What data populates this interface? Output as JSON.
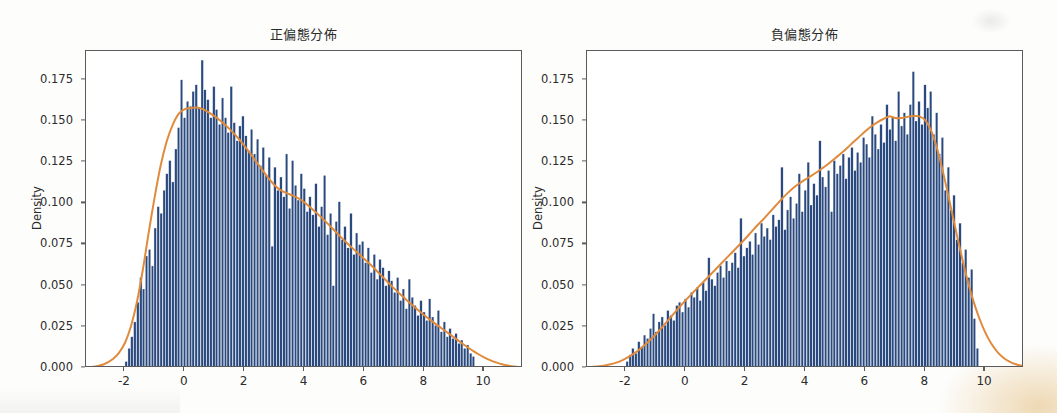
{
  "figure": {
    "background": "#fdfdfc",
    "panel_background": "#ffffff",
    "frame_color": "#5b5b5b"
  },
  "style": {
    "bar_color": "#2a4a7f",
    "bar_edge_color": "#ffffff",
    "kde_color": "#e08a3c",
    "text_color": "#2b2b2b"
  },
  "panels": [
    {
      "id": "left",
      "title": "正偏態分佈",
      "ylabel": "Density",
      "yticks": [
        "0.000",
        "0.025",
        "0.050",
        "0.075",
        "0.100",
        "0.125",
        "0.150",
        "0.175"
      ],
      "xticks": [
        "-2",
        "0",
        "2",
        "4",
        "6",
        "8",
        "10"
      ]
    },
    {
      "id": "right",
      "title": "負偏態分佈",
      "ylabel": "Density",
      "yticks": [
        "0.000",
        "0.025",
        "0.050",
        "0.075",
        "0.100",
        "0.125",
        "0.150",
        "0.175"
      ],
      "xticks": [
        "-2",
        "0",
        "2",
        "4",
        "6",
        "8",
        "10"
      ]
    }
  ],
  "chart_data": [
    {
      "type": "bar",
      "subtype": "histogram-with-kde",
      "title": "正偏態分佈",
      "xlabel": "",
      "ylabel": "Density",
      "xlim": [
        -3.3,
        11.3
      ],
      "ylim": [
        0.0,
        0.1925
      ],
      "xticks": [
        -2,
        0,
        2,
        4,
        6,
        8,
        10
      ],
      "yticks": [
        0.0,
        0.025,
        0.05,
        0.075,
        0.1,
        0.125,
        0.15,
        0.175
      ],
      "grid": false,
      "legend": "none",
      "bin_width": 0.0975,
      "bin_centers": [
        -1.95,
        -1.85,
        -1.76,
        -1.66,
        -1.56,
        -1.46,
        -1.37,
        -1.27,
        -1.17,
        -1.07,
        -0.98,
        -0.88,
        -0.78,
        -0.68,
        -0.59,
        -0.49,
        -0.39,
        -0.29,
        -0.2,
        -0.1,
        0,
        0.1,
        0.2,
        0.29,
        0.39,
        0.49,
        0.59,
        0.68,
        0.78,
        0.88,
        0.98,
        1.07,
        1.17,
        1.27,
        1.37,
        1.46,
        1.56,
        1.66,
        1.76,
        1.85,
        1.95,
        2.05,
        2.15,
        2.24,
        2.34,
        2.44,
        2.54,
        2.63,
        2.73,
        2.83,
        2.93,
        3.02,
        3.12,
        3.22,
        3.32,
        3.41,
        3.51,
        3.61,
        3.71,
        3.8,
        3.9,
        4,
        4.1,
        4.19,
        4.29,
        4.39,
        4.49,
        4.58,
        4.68,
        4.78,
        4.88,
        4.97,
        5.07,
        5.17,
        5.27,
        5.36,
        5.46,
        5.56,
        5.66,
        5.75,
        5.85,
        5.95,
        6.05,
        6.14,
        6.24,
        6.34,
        6.44,
        6.53,
        6.63,
        6.73,
        6.83,
        6.92,
        7.02,
        7.12,
        7.22,
        7.31,
        7.41,
        7.51,
        7.61,
        7.7,
        7.8,
        7.9,
        8,
        8.09,
        8.19,
        8.29,
        8.39,
        8.48,
        8.58,
        8.68,
        8.78,
        8.87,
        8.97,
        9.07,
        9.17,
        9.26,
        9.36,
        9.46,
        9.56,
        9.65,
        9.75
      ],
      "bin_densities": [
        0.004,
        0.012,
        0.019,
        0.028,
        0.04,
        0.055,
        0.048,
        0.068,
        0.072,
        0.062,
        0.085,
        0.098,
        0.094,
        0.108,
        0.118,
        0.126,
        0.113,
        0.133,
        0.146,
        0.175,
        0.152,
        0.162,
        0.159,
        0.168,
        0.172,
        0.158,
        0.187,
        0.169,
        0.163,
        0.152,
        0.171,
        0.157,
        0.148,
        0.164,
        0.152,
        0.143,
        0.171,
        0.149,
        0.138,
        0.147,
        0.153,
        0.141,
        0.132,
        0.145,
        0.13,
        0.139,
        0.123,
        0.134,
        0.117,
        0.128,
        0.074,
        0.122,
        0.108,
        0.116,
        0.104,
        0.13,
        0.097,
        0.126,
        0.111,
        0.102,
        0.118,
        0.109,
        0.095,
        0.104,
        0.093,
        0.112,
        0.086,
        0.098,
        0.117,
        0.081,
        0.094,
        0.05,
        0.089,
        0.101,
        0.078,
        0.086,
        0.073,
        0.094,
        0.069,
        0.082,
        0.075,
        0.077,
        0.064,
        0.073,
        0.058,
        0.069,
        0.054,
        0.066,
        0.061,
        0.05,
        0.059,
        0.053,
        0.046,
        0.055,
        0.041,
        0.048,
        0.036,
        0.054,
        0.043,
        0.038,
        0.032,
        0.041,
        0.034,
        0.029,
        0.042,
        0.031,
        0.026,
        0.035,
        0.022,
        0.028,
        0.019,
        0.024,
        0.018,
        0.021,
        0.015,
        0.017,
        0.012,
        0.014,
        0.009,
        0.007
      ],
      "kde_x": [
        -3.3,
        -3.0,
        -2.7,
        -2.4,
        -2.2,
        -2.0,
        -1.8,
        -1.6,
        -1.4,
        -1.2,
        -1.0,
        -0.8,
        -0.6,
        -0.4,
        -0.2,
        0.0,
        0.2,
        0.4,
        0.6,
        0.8,
        1.0,
        1.2,
        1.4,
        1.6,
        1.8,
        2.0,
        2.2,
        2.4,
        2.6,
        2.8,
        3.0,
        3.2,
        3.4,
        3.6,
        3.8,
        4.0,
        4.2,
        4.4,
        4.6,
        4.8,
        5.0,
        5.2,
        5.4,
        5.6,
        5.8,
        6.0,
        6.2,
        6.4,
        6.6,
        6.8,
        7.0,
        7.2,
        7.4,
        7.6,
        7.8,
        8.0,
        8.2,
        8.4,
        8.6,
        8.8,
        9.0,
        9.2,
        9.4,
        9.6,
        9.8,
        10.0,
        10.2,
        10.4,
        10.6,
        10.8,
        11.0,
        11.3
      ],
      "kde_y": [
        0.0003,
        0.0009,
        0.0023,
        0.0055,
        0.0092,
        0.0152,
        0.0252,
        0.0399,
        0.0598,
        0.0828,
        0.1044,
        0.1234,
        0.1378,
        0.1478,
        0.1545,
        0.1572,
        0.1578,
        0.1582,
        0.1572,
        0.1552,
        0.1528,
        0.15,
        0.1468,
        0.1432,
        0.1392,
        0.1348,
        0.13,
        0.125,
        0.12,
        0.1152,
        0.111,
        0.108,
        0.1062,
        0.1048,
        0.103,
        0.1005,
        0.0975,
        0.0942,
        0.0908,
        0.0872,
        0.0835,
        0.0798,
        0.0762,
        0.0728,
        0.0695,
        0.0662,
        0.0628,
        0.0592,
        0.0555,
        0.0518,
        0.0482,
        0.0448,
        0.0415,
        0.0382,
        0.035,
        0.032,
        0.0292,
        0.0265,
        0.0238,
        0.0212,
        0.0185,
        0.0158,
        0.0132,
        0.0108,
        0.0085,
        0.0065,
        0.0048,
        0.0034,
        0.0023,
        0.0015,
        0.0009,
        0.0004
      ]
    },
    {
      "type": "bar",
      "subtype": "histogram-with-kde",
      "title": "負偏態分佈",
      "xlabel": "",
      "ylabel": "Density",
      "xlim": [
        -3.3,
        11.3
      ],
      "ylim": [
        0.0,
        0.1925
      ],
      "xticks": [
        -2,
        0,
        2,
        4,
        6,
        8,
        10
      ],
      "yticks": [
        0.0,
        0.025,
        0.05,
        0.075,
        0.1,
        0.125,
        0.15,
        0.175
      ],
      "grid": false,
      "legend": "none",
      "bin_width": 0.0975,
      "bin_centers": [
        -1.95,
        -1.85,
        -1.76,
        -1.66,
        -1.56,
        -1.46,
        -1.37,
        -1.27,
        -1.17,
        -1.07,
        -0.98,
        -0.88,
        -0.78,
        -0.68,
        -0.59,
        -0.49,
        -0.39,
        -0.29,
        -0.2,
        -0.1,
        0,
        0.1,
        0.2,
        0.29,
        0.39,
        0.49,
        0.59,
        0.68,
        0.78,
        0.88,
        0.98,
        1.07,
        1.17,
        1.27,
        1.37,
        1.46,
        1.56,
        1.66,
        1.76,
        1.85,
        1.95,
        2.05,
        2.15,
        2.24,
        2.34,
        2.44,
        2.54,
        2.63,
        2.73,
        2.83,
        2.93,
        3.02,
        3.12,
        3.22,
        3.32,
        3.41,
        3.51,
        3.61,
        3.71,
        3.8,
        3.9,
        4,
        4.1,
        4.19,
        4.29,
        4.39,
        4.49,
        4.58,
        4.68,
        4.78,
        4.88,
        4.97,
        5.07,
        5.17,
        5.27,
        5.36,
        5.46,
        5.56,
        5.66,
        5.75,
        5.85,
        5.95,
        6.05,
        6.14,
        6.24,
        6.34,
        6.44,
        6.53,
        6.63,
        6.73,
        6.83,
        6.92,
        7.02,
        7.12,
        7.22,
        7.31,
        7.41,
        7.51,
        7.61,
        7.7,
        7.8,
        7.9,
        8,
        8.09,
        8.19,
        8.29,
        8.39,
        8.48,
        8.58,
        8.68,
        8.78,
        8.87,
        8.97,
        9.07,
        9.17,
        9.26,
        9.36,
        9.46,
        9.56,
        9.65,
        9.75
      ],
      "bin_densities": [
        0.004,
        0.008,
        0.012,
        0.009,
        0.016,
        0.013,
        0.02,
        0.018,
        0.024,
        0.033,
        0.022,
        0.028,
        0.031,
        0.026,
        0.035,
        0.032,
        0.029,
        0.038,
        0.04,
        0.034,
        0.042,
        0.037,
        0.046,
        0.043,
        0.049,
        0.041,
        0.052,
        0.047,
        0.067,
        0.054,
        0.05,
        0.058,
        0.062,
        0.055,
        0.065,
        0.059,
        0.064,
        0.07,
        0.061,
        0.091,
        0.068,
        0.073,
        0.077,
        0.069,
        0.082,
        0.075,
        0.088,
        0.08,
        0.085,
        0.078,
        0.093,
        0.086,
        0.09,
        0.122,
        0.084,
        0.096,
        0.104,
        0.091,
        0.1,
        0.118,
        0.095,
        0.108,
        0.125,
        0.099,
        0.112,
        0.105,
        0.138,
        0.116,
        0.11,
        0.12,
        0.095,
        0.126,
        0.118,
        0.123,
        0.13,
        0.115,
        0.128,
        0.134,
        0.12,
        0.131,
        0.125,
        0.14,
        0.136,
        0.128,
        0.153,
        0.142,
        0.133,
        0.148,
        0.137,
        0.16,
        0.145,
        0.152,
        0.138,
        0.168,
        0.147,
        0.155,
        0.142,
        0.16,
        0.18,
        0.15,
        0.162,
        0.148,
        0.172,
        0.158,
        0.168,
        0.142,
        0.155,
        0.13,
        0.14,
        0.108,
        0.122,
        0.096,
        0.105,
        0.078,
        0.088,
        0.064,
        0.072,
        0.055,
        0.06,
        0.03,
        0.012
      ],
      "kde_x": [
        -3.3,
        -3.0,
        -2.7,
        -2.4,
        -2.2,
        -2.0,
        -1.8,
        -1.6,
        -1.4,
        -1.2,
        -1.0,
        -0.8,
        -0.6,
        -0.4,
        -0.2,
        0.0,
        0.2,
        0.4,
        0.6,
        0.8,
        1.0,
        1.2,
        1.4,
        1.6,
        1.8,
        2.0,
        2.2,
        2.4,
        2.6,
        2.8,
        3.0,
        3.2,
        3.4,
        3.6,
        3.8,
        4.0,
        4.2,
        4.4,
        4.6,
        4.8,
        5.0,
        5.2,
        5.4,
        5.6,
        5.8,
        6.0,
        6.2,
        6.4,
        6.6,
        6.8,
        7.0,
        7.2,
        7.4,
        7.6,
        7.8,
        8.0,
        8.2,
        8.4,
        8.6,
        8.8,
        9.0,
        9.2,
        9.4,
        9.6,
        9.8,
        10.0,
        10.2,
        10.4,
        10.6,
        10.8,
        11.0,
        11.3
      ],
      "kde_y": [
        0.0004,
        0.0009,
        0.0016,
        0.0028,
        0.004,
        0.0058,
        0.008,
        0.0105,
        0.0135,
        0.0168,
        0.0205,
        0.0245,
        0.0288,
        0.033,
        0.0372,
        0.0412,
        0.045,
        0.0488,
        0.0525,
        0.0562,
        0.06,
        0.0638,
        0.0675,
        0.0712,
        0.075,
        0.0788,
        0.0828,
        0.0868,
        0.0905,
        0.0945,
        0.0985,
        0.1025,
        0.1062,
        0.1095,
        0.1122,
        0.1145,
        0.1168,
        0.1192,
        0.1218,
        0.1245,
        0.1275,
        0.1305,
        0.1338,
        0.1372,
        0.1405,
        0.1438,
        0.1468,
        0.1492,
        0.1512,
        0.1528,
        0.1518,
        0.1518,
        0.1525,
        0.153,
        0.1528,
        0.1505,
        0.144,
        0.133,
        0.1185,
        0.1022,
        0.0855,
        0.0692,
        0.0542,
        0.0412,
        0.0305,
        0.0218,
        0.015,
        0.01,
        0.0064,
        0.004,
        0.0024,
        0.001
      ]
    }
  ]
}
